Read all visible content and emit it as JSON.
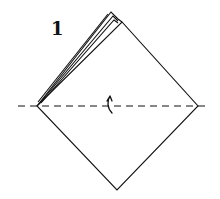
{
  "diagram": {
    "type": "origami-step",
    "step_number": "1",
    "elements": {
      "square": "diamond-oriented square base",
      "flaps": "layered flaps along upper-left edge",
      "fold_line": "horizontal valley fold (dashed)",
      "arrow": "fold-up arrow"
    },
    "colors": {
      "stroke": "#111111",
      "background": "#ffffff"
    }
  }
}
